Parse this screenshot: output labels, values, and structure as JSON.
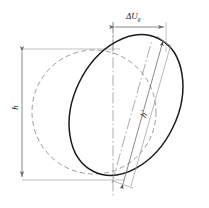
{
  "figure": {
    "background_color": "#ffffff",
    "width": 209,
    "height": 208
  },
  "labels": {
    "height_original": "h",
    "height_deformed_base": "h",
    "height_deformed_prime": "′",
    "offset_symbol": "ΔU",
    "offset_subscript": "g"
  },
  "colors": {
    "solid_outline": "#1a1a1a",
    "dashed_outline": "#8a8a8a",
    "dimension_line": "#9a9a9a",
    "centerline": "#8a8a8a",
    "text": "#1a1a1a"
  },
  "shapes": {
    "dashed_circle": {
      "name": "original-circle",
      "style": "dashed",
      "center_x": 94,
      "center_y": 112,
      "radius": 62
    },
    "solid_ellipse": {
      "name": "deformed-ellipse",
      "style": "solid",
      "center_x": 126,
      "center_y": 105,
      "semi_major": 74,
      "semi_minor": 52,
      "rotation_deg": -64
    }
  },
  "dimensions": {
    "vertical": {
      "name": "h",
      "orientation": "vertical",
      "x": 22,
      "y_top": 49,
      "y_bottom": 180,
      "arrows": "both"
    },
    "horizontal": {
      "name": "ΔUg",
      "orientation": "horizontal",
      "y": 27,
      "x_left": 112,
      "x_right": 166,
      "arrows": "both"
    },
    "diagonal": {
      "name": "h′",
      "orientation": "diagonal",
      "x_start": 128,
      "y_start": 184,
      "x_end": 167,
      "y_end": 42,
      "arrows": "both"
    }
  },
  "guides": {
    "centerline_vertical": {
      "x": 113,
      "y_top": 20,
      "y_bottom": 196
    },
    "extension_top": {
      "y": 49,
      "x_left": 22,
      "x_right": 118
    },
    "extension_bottom": {
      "y": 180,
      "x_left": 22,
      "x_right": 120
    },
    "extension_offset_left": {
      "x": 113,
      "y_top": 22,
      "y_bottom": 52
    },
    "extension_offset_right": {
      "x": 166,
      "y_top": 22,
      "y_bottom": 50
    }
  }
}
